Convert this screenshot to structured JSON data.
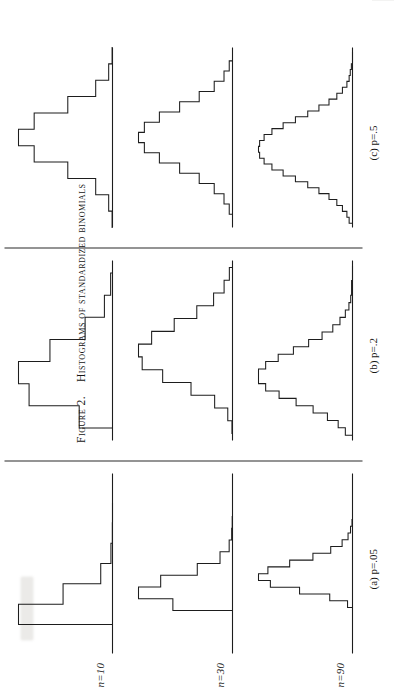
{
  "figure": {
    "caption_number": "Figure 2.",
    "caption_text": "Histograms of standardized binomials",
    "row_labels": [
      {
        "id": "n10",
        "text": "n=10"
      },
      {
        "id": "n30",
        "text": "n=30"
      },
      {
        "id": "n90",
        "text": "n=90"
      }
    ],
    "column_labels": [
      {
        "id": "a",
        "text": "(a) p=.05"
      },
      {
        "id": "b",
        "text": "(b) p=.2"
      },
      {
        "id": "c",
        "text": "(c) p=.5"
      }
    ],
    "ink_color": "#1d1d1d",
    "paper_color": "#ffffff"
  },
  "chart_data": [
    {
      "id": "n10-p05",
      "type": "bar",
      "title": "n=10, p=.05",
      "row": "n=10",
      "column": "(a) p=.05",
      "xlabel": "standardized deviate",
      "ylabel": "probability",
      "grid": false,
      "legend": "none",
      "note": "Standardized binomial histogram; bars drawn as a step outline above a horizontal baseline axis.",
      "categories": [
        "0",
        "1",
        "2",
        "3",
        "4",
        "5"
      ],
      "values": [
        0.599,
        0.315,
        0.075,
        0.01,
        0.001,
        0.0
      ],
      "bar_widths": [
        0.726,
        0.726,
        0.726,
        0.726,
        0.726,
        0.726
      ],
      "ylim": [
        0,
        0.64
      ]
    },
    {
      "id": "n10-p2",
      "type": "bar",
      "title": "n=10, p=.2",
      "row": "n=10",
      "column": "(b) p=.2",
      "xlabel": "standardized deviate",
      "ylabel": "probability",
      "grid": false,
      "legend": "none",
      "categories": [
        "0",
        "1",
        "2",
        "3",
        "4",
        "5",
        "6"
      ],
      "values": [
        0.107,
        0.268,
        0.302,
        0.201,
        0.088,
        0.026,
        0.006
      ],
      "bar_widths": [
        0.79,
        0.79,
        0.79,
        0.79,
        0.79,
        0.79,
        0.79
      ],
      "ylim": [
        0,
        0.33
      ]
    },
    {
      "id": "n10-p5",
      "type": "bar",
      "title": "n=10, p=.5",
      "row": "n=10",
      "column": "(c) p=.5",
      "xlabel": "standardized deviate",
      "ylabel": "probability",
      "grid": false,
      "legend": "none",
      "categories": [
        "0",
        "1",
        "2",
        "3",
        "4",
        "5",
        "6",
        "7",
        "8",
        "9",
        "10"
      ],
      "values": [
        0.001,
        0.01,
        0.044,
        0.117,
        0.205,
        0.246,
        0.205,
        0.117,
        0.044,
        0.01,
        0.001
      ],
      "bar_widths": [
        0.632,
        0.632,
        0.632,
        0.632,
        0.632,
        0.632,
        0.632,
        0.632,
        0.632,
        0.632,
        0.632
      ],
      "ylim": [
        0,
        0.27
      ]
    },
    {
      "id": "n30-p05",
      "type": "bar",
      "title": "n=30, p=.05",
      "row": "n=30",
      "column": "(a) p=.05",
      "xlabel": "standardized deviate",
      "ylabel": "probability",
      "grid": false,
      "legend": "none",
      "categories": [
        "0",
        "1",
        "2",
        "3",
        "4",
        "5",
        "6",
        "7"
      ],
      "values": [
        0.215,
        0.339,
        0.259,
        0.127,
        0.045,
        0.012,
        0.003,
        0.001
      ],
      "bar_widths": [
        0.419,
        0.419,
        0.419,
        0.419,
        0.419,
        0.419,
        0.419,
        0.419
      ],
      "ylim": [
        0,
        0.37
      ]
    },
    {
      "id": "n30-p2",
      "type": "bar",
      "title": "n=30, p=.2",
      "row": "n=30",
      "column": "(b) p=.2",
      "xlabel": "standardized deviate",
      "ylabel": "probability",
      "grid": false,
      "legend": "none",
      "categories": [
        "0",
        "1",
        "2",
        "3",
        "4",
        "5",
        "6",
        "7",
        "8",
        "9",
        "10",
        "11",
        "12"
      ],
      "values": [
        0.001,
        0.009,
        0.034,
        0.079,
        0.133,
        0.172,
        0.179,
        0.154,
        0.111,
        0.068,
        0.036,
        0.016,
        0.006
      ],
      "bar_widths": [
        0.456,
        0.456,
        0.456,
        0.456,
        0.456,
        0.456,
        0.456,
        0.456,
        0.456,
        0.456,
        0.456,
        0.456,
        0.456
      ],
      "ylim": [
        0,
        0.2
      ]
    },
    {
      "id": "n30-p5",
      "type": "bar",
      "title": "n=30, p=.5",
      "row": "n=30",
      "column": "(c) p=.5",
      "xlabel": "standardized deviate",
      "ylabel": "probability",
      "grid": false,
      "legend": "none",
      "categories": [
        "8",
        "9",
        "10",
        "11",
        "12",
        "13",
        "14",
        "15",
        "16",
        "17",
        "18",
        "19",
        "20",
        "21",
        "22"
      ],
      "values": [
        0.005,
        0.013,
        0.028,
        0.051,
        0.081,
        0.112,
        0.135,
        0.144,
        0.135,
        0.112,
        0.081,
        0.051,
        0.028,
        0.013,
        0.005
      ],
      "bar_widths": [
        0.365,
        0.365,
        0.365,
        0.365,
        0.365,
        0.365,
        0.365,
        0.365,
        0.365,
        0.365,
        0.365,
        0.365,
        0.365,
        0.365,
        0.365
      ],
      "ylim": [
        0,
        0.16
      ]
    },
    {
      "id": "n90-p05",
      "type": "bar",
      "title": "n=90, p=.05",
      "row": "n=90",
      "column": "(a) p=.05",
      "xlabel": "standardized deviate",
      "ylabel": "probability",
      "grid": false,
      "legend": "none",
      "categories": [
        "0",
        "1",
        "2",
        "3",
        "4",
        "5",
        "6",
        "7",
        "8",
        "9",
        "10",
        "11",
        "12"
      ],
      "values": [
        0.01,
        0.046,
        0.107,
        0.166,
        0.19,
        0.171,
        0.127,
        0.08,
        0.044,
        0.021,
        0.009,
        0.004,
        0.001
      ],
      "bar_widths": [
        0.242,
        0.242,
        0.242,
        0.242,
        0.242,
        0.242,
        0.242,
        0.242,
        0.242,
        0.242,
        0.242,
        0.242,
        0.242
      ],
      "ylim": [
        0,
        0.21
      ]
    },
    {
      "id": "n90-p2",
      "type": "bar",
      "title": "n=90, p=.2",
      "row": "n=90",
      "column": "(b) p=.2",
      "xlabel": "standardized deviate",
      "ylabel": "probability",
      "grid": false,
      "legend": "none",
      "categories": [
        "7",
        "8",
        "9",
        "10",
        "11",
        "12",
        "13",
        "14",
        "15",
        "16",
        "17",
        "18",
        "19",
        "20",
        "21",
        "22",
        "23",
        "24",
        "25",
        "26",
        "27",
        "28",
        "29"
      ],
      "values": [
        0.008,
        0.016,
        0.028,
        0.044,
        0.063,
        0.082,
        0.097,
        0.105,
        0.105,
        0.097,
        0.083,
        0.066,
        0.049,
        0.034,
        0.022,
        0.014,
        0.008,
        0.004,
        0.002,
        0.001,
        0.001,
        0.0,
        0.0
      ],
      "bar_widths": [
        0.263,
        0.263,
        0.263,
        0.263,
        0.263,
        0.263,
        0.263,
        0.263,
        0.263,
        0.263,
        0.263,
        0.263,
        0.263,
        0.263,
        0.263,
        0.263,
        0.263,
        0.263,
        0.263,
        0.263,
        0.263,
        0.263,
        0.263
      ],
      "ylim": [
        0,
        0.115
      ]
    },
    {
      "id": "n90-p5",
      "type": "bar",
      "title": "n=90, p=.5",
      "row": "n=90",
      "column": "(c) p=.5",
      "xlabel": "standardized deviate",
      "ylabel": "probability",
      "grid": false,
      "legend": "none",
      "categories": [
        "31",
        "32",
        "33",
        "34",
        "35",
        "36",
        "37",
        "38",
        "39",
        "40",
        "41",
        "42",
        "43",
        "44",
        "45",
        "46",
        "47",
        "48",
        "49",
        "50",
        "51",
        "52",
        "53",
        "54",
        "55",
        "56",
        "57",
        "58",
        "59"
      ],
      "values": [
        0.003,
        0.005,
        0.009,
        0.014,
        0.021,
        0.03,
        0.04,
        0.051,
        0.062,
        0.072,
        0.079,
        0.083,
        0.084,
        0.083,
        0.079,
        0.072,
        0.062,
        0.051,
        0.04,
        0.03,
        0.021,
        0.014,
        0.009,
        0.005,
        0.003,
        0.002,
        0.001,
        0.0,
        0.0
      ],
      "bar_widths": [
        0.211,
        0.211,
        0.211,
        0.211,
        0.211,
        0.211,
        0.211,
        0.211,
        0.211,
        0.211,
        0.211,
        0.211,
        0.211,
        0.211,
        0.211,
        0.211,
        0.211,
        0.211,
        0.211,
        0.211,
        0.211,
        0.211,
        0.211,
        0.211,
        0.211,
        0.211,
        0.211,
        0.211,
        0.211
      ]
    }
  ]
}
